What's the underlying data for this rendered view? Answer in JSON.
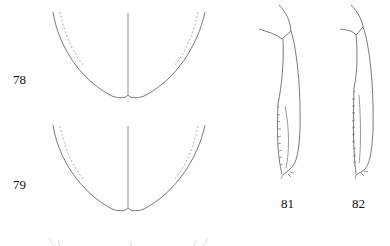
{
  "figure": {
    "type": "scientific-illustration-plate",
    "labels": {
      "fig78": "78",
      "fig79": "79",
      "fig81": "81",
      "fig82": "82"
    },
    "panels": [
      {
        "id": "78",
        "depicts": "elytral apex outline, dorsal view, with sutural line and dashed inner margin"
      },
      {
        "id": "79",
        "depicts": "elytral apex outline, dorsal view, with sutural line and dashed inner margin"
      },
      {
        "id": "81",
        "depicts": "hind leg femur/tibia with denticulate margin"
      },
      {
        "id": "82",
        "depicts": "hind leg femur/tibia with denticulate margin"
      },
      {
        "id": "partial",
        "depicts": "partially cropped drawing at bottom edge"
      }
    ]
  }
}
